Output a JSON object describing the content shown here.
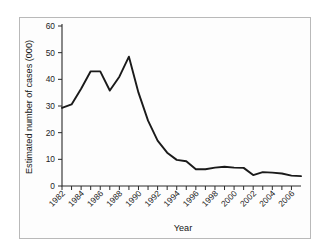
{
  "chart_data": {
    "type": "line",
    "title": "",
    "xlabel": "Year",
    "ylabel": "Estimated number of cases (000)",
    "xlim": [
      1982,
      2007
    ],
    "ylim": [
      0,
      60
    ],
    "yticks": [
      0,
      10,
      20,
      30,
      40,
      50,
      60
    ],
    "xticks_labeled": [
      1982,
      1984,
      1986,
      1988,
      1990,
      1992,
      1994,
      1996,
      1998,
      2000,
      2002,
      2004,
      2006
    ],
    "xticks_minor_every": 1,
    "grid": false,
    "legend": null,
    "series": [
      {
        "name": "Estimated number of cases (000)",
        "color": "#1a1a1a",
        "x": [
          1982,
          1983,
          1984,
          1985,
          1986,
          1987,
          1988,
          1989,
          1990,
          1991,
          1992,
          1993,
          1994,
          1995,
          1996,
          1997,
          1998,
          1999,
          2000,
          2001,
          2002,
          2003,
          2004,
          2005,
          2006,
          2007
        ],
        "values": [
          29.3,
          30.6,
          36.5,
          43.0,
          43.0,
          35.8,
          41.0,
          48.5,
          35.0,
          24.5,
          17.0,
          12.5,
          9.8,
          9.3,
          6.3,
          6.3,
          6.9,
          7.2,
          6.9,
          6.8,
          4.1,
          5.2,
          5.0,
          4.7,
          3.9,
          3.7
        ]
      }
    ]
  },
  "axes": {
    "y_tick_labels": [
      "0",
      "10",
      "20",
      "30",
      "40",
      "50",
      "60"
    ],
    "x_tick_labels": [
      "1982",
      "1984",
      "1986",
      "1988",
      "1990",
      "1992",
      "1994",
      "1996",
      "1998",
      "2000",
      "2002",
      "2004",
      "2006"
    ],
    "y_axis_title": "Estimated number of cases (000)",
    "x_axis_title": "Year"
  },
  "style": {
    "line_color": "#1a1a1a",
    "axis_color": "#2a2a2a",
    "border_color": "#b9b9b9",
    "background": "#ffffff"
  }
}
